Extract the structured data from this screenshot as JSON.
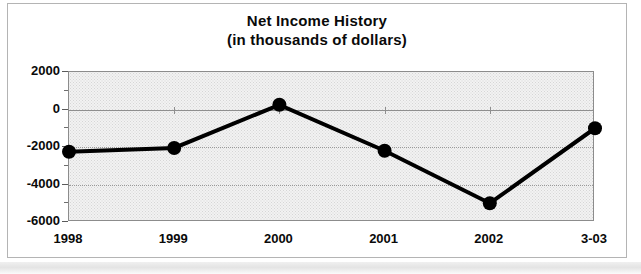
{
  "chart_data": {
    "type": "line",
    "title": "Net Income History",
    "subtitle": "(in thousands of dollars)",
    "title_lines": [
      "Net Income History",
      "(in thousands of dollars)"
    ],
    "xlabel": "",
    "ylabel": "",
    "categories": [
      "1998",
      "1999",
      "2000",
      "2001",
      "2002",
      "3-03"
    ],
    "values": [
      -2250,
      -2050,
      250,
      -2200,
      -5000,
      -1000
    ],
    "series": [
      {
        "name": "Net Income",
        "values": [
          -2250,
          -2050,
          250,
          -2200,
          -5000,
          -1000
        ]
      }
    ],
    "ylim": [
      -6000,
      2000
    ],
    "yticks": [
      2000,
      0,
      -2000,
      -4000,
      -6000
    ],
    "ytick_labels": [
      "2000",
      "0",
      "-2000",
      "-4000",
      "-6000"
    ],
    "y_minor_ticks": [
      1000,
      -1000,
      -3000,
      -5000
    ],
    "grid": true,
    "grid_axis": "y",
    "legend": false,
    "legend_position": "none",
    "marker": "circle",
    "marker_color": "#000000",
    "line_color": "#000000",
    "plot_background": "#f2f2f2",
    "annotations": []
  },
  "figure": {
    "frame_color": "#b4b4b4",
    "background": "#ffffff"
  }
}
